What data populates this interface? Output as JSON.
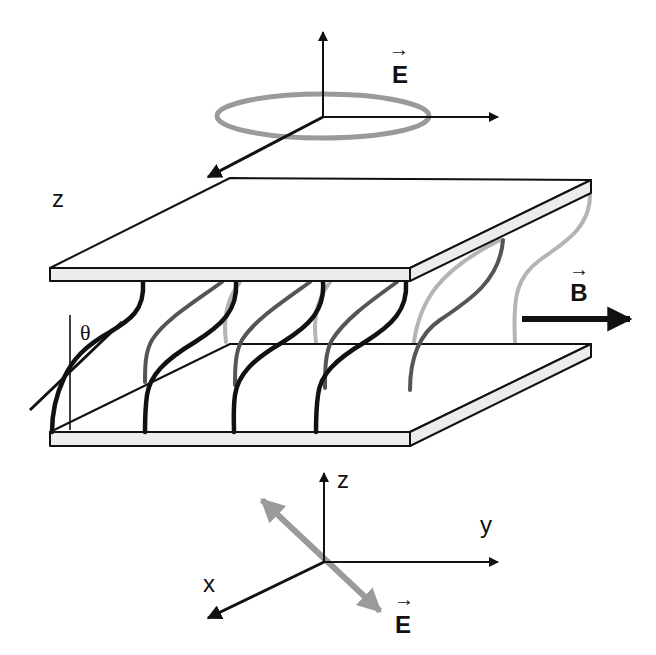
{
  "figure": {
    "colors": {
      "ink": "#111111",
      "plate_fill": "#ececec",
      "molecule_front": "#111111",
      "molecule_mid": "#555555",
      "molecule_back": "#b4b4b4",
      "rotating_field_ring": "#9a9a9a",
      "field_arrow_gray": "#9a9a9a"
    }
  },
  "top_axes": {
    "e_field_label": "E",
    "e_field_vector_marker": "→"
  },
  "cell": {
    "z_label": "z",
    "tilt_angle_label": "θ",
    "b_field_label": "B",
    "b_field_vector_marker": "→"
  },
  "bottom_axes": {
    "z_label": "z",
    "y_label": "y",
    "x_label": "x",
    "e_field_label": "E",
    "e_field_vector_marker": "→"
  }
}
